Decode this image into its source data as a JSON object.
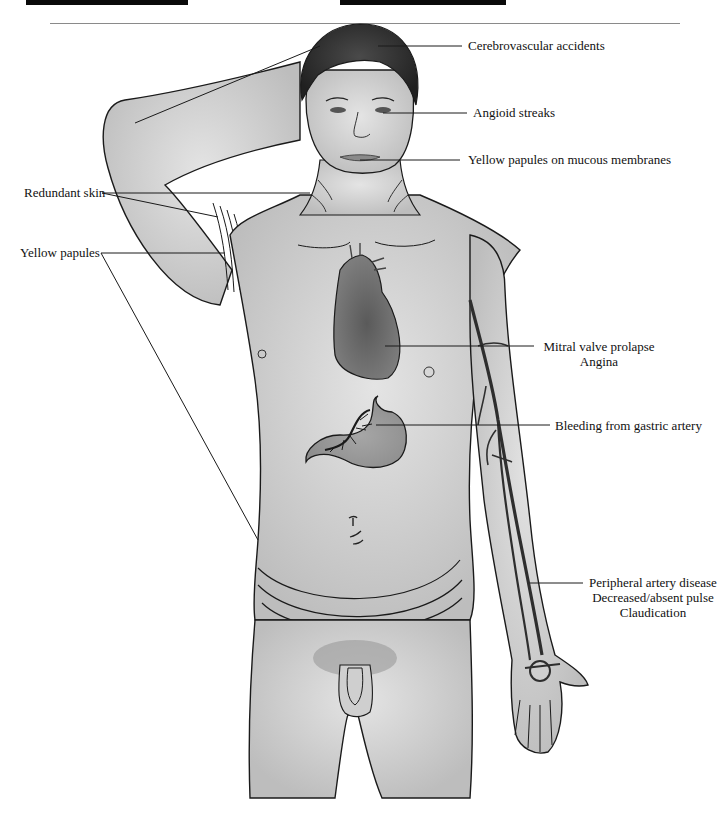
{
  "figure": {
    "colors": {
      "skin": "#d4d4d4",
      "outline": "#1a1a1a",
      "hair": "#3a3a3a",
      "organ": "#6e6e6e",
      "artery": "#2e2e2e",
      "rule": "#8a8a8a",
      "bar": "#0a0a0a"
    }
  },
  "labels": {
    "cerebrovascular": {
      "text": "Cerebrovascular accidents"
    },
    "angioid": {
      "text": "Angioid streaks"
    },
    "mucous": {
      "text": "Yellow papules on mucous membranes"
    },
    "redundant_skin": {
      "text": "Redundant skin"
    },
    "yellow_papules": {
      "text": "Yellow papules"
    },
    "cardiac": {
      "lines": [
        "Mitral valve prolapse",
        "Angina"
      ]
    },
    "gastric": {
      "text": "Bleeding from gastric artery"
    },
    "peripheral": {
      "lines": [
        "Peripheral artery disease",
        "Decreased/absent pulse",
        "Claudication"
      ]
    }
  }
}
